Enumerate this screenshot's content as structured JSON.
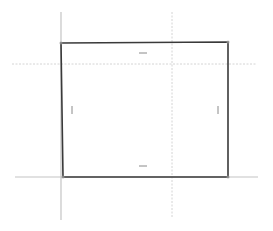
{
  "canvas": {
    "width": 273,
    "height": 231,
    "background": "#ffffff"
  },
  "colors": {
    "rect_stroke": "#3a3a3a",
    "guide_solid": "#c4c4c4",
    "guide_dashed": "#d4d4d4",
    "tick": "#8a8a8a",
    "corner_handle": "#9a9a9a"
  },
  "rectangle": {
    "points": [
      [
        61,
        43
      ],
      [
        228,
        42
      ],
      [
        228,
        177
      ],
      [
        63,
        177
      ]
    ],
    "stroke_width": 1.6
  },
  "guides": {
    "vertical_solid": {
      "x": 61,
      "y1": 12,
      "y2": 220
    },
    "horizontal_solid": {
      "y": 177,
      "x1": 15,
      "x2": 258
    },
    "horizontal_dashed": {
      "y": 64,
      "x1": 12,
      "x2": 256
    },
    "vertical_dashed": {
      "x": 172,
      "y1": 12,
      "y2": 218
    }
  },
  "ticks": [
    {
      "name": "top-midpoint-tick",
      "x1": 139,
      "y1": 53,
      "x2": 147,
      "y2": 53
    },
    {
      "name": "bottom-midpoint-tick",
      "x1": 139,
      "y1": 166,
      "x2": 147,
      "y2": 166
    },
    {
      "name": "left-midpoint-tick",
      "x1": 72,
      "y1": 106,
      "x2": 72,
      "y2": 114
    },
    {
      "name": "right-midpoint-tick",
      "x1": 218,
      "y1": 106,
      "x2": 218,
      "y2": 114
    }
  ],
  "corner_handles": [
    {
      "name": "top-left-corner-handle",
      "x": 61,
      "y": 43
    },
    {
      "name": "top-right-corner-handle",
      "x": 228,
      "y": 42
    },
    {
      "name": "bottom-right-corner-handle",
      "x": 228,
      "y": 177
    },
    {
      "name": "bottom-left-corner-handle",
      "x": 63,
      "y": 177
    }
  ]
}
